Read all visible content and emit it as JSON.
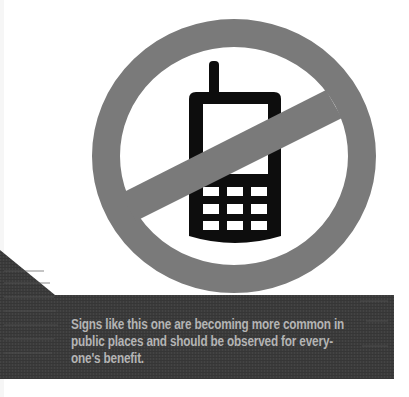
{
  "figure": {
    "type": "prohibition-sign",
    "colors": {
      "background": "#ffffff",
      "ring": "#7a7a7a",
      "phone": "#0d0d0d",
      "phone_screen": "#ffffff",
      "keypad_keys": "#ffffff",
      "banner": "#3b3b3b",
      "banner_texture": "#474747",
      "caption_text": "#b4b4b4"
    },
    "keypad": {
      "rows": 3,
      "columns": 3
    }
  },
  "caption": {
    "lines": [
      "Signs like this one are becoming more common in",
      "public places and should be observed for every-",
      "one's benefit."
    ]
  }
}
